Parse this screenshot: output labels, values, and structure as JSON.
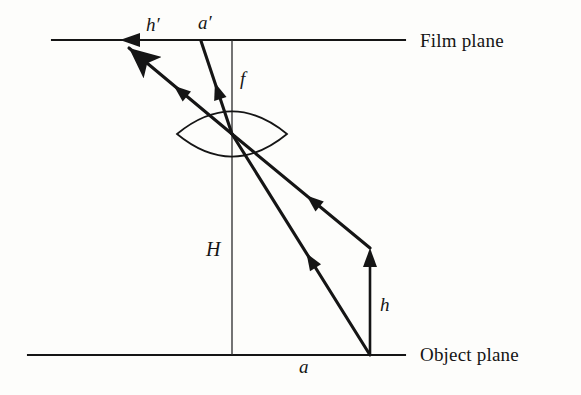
{
  "figure": {
    "kind": "thin-lens-imaging-diagram",
    "background_color": "#fdfdfb",
    "ink_color": "#151515"
  },
  "planes": {
    "film": {
      "label": "Film plane",
      "label_x": 420,
      "label_y": 30,
      "line_y": 40,
      "line_x1": 52,
      "line_x2": 405
    },
    "object": {
      "label": "Object plane",
      "label_x": 420,
      "label_y": 344,
      "line_y": 355,
      "line_x1": 28,
      "line_x2": 405
    }
  },
  "axis": {
    "name": "optical-axis",
    "x": 232,
    "y_top": 40,
    "y_bottom": 355
  },
  "lens": {
    "name": "biconvex-lens",
    "center_x": 232,
    "center_y": 134,
    "half_width": 55,
    "half_height": 21
  },
  "object_arrow": {
    "name": "object-height-arrow",
    "x": 370,
    "y_base": 355,
    "y_tip": 248
  },
  "rays": [
    {
      "name": "chief-ray-from-object-base",
      "from_x": 370,
      "from_y": 355,
      "through_x": 232,
      "through_y": 134,
      "to_x": 120,
      "to_y": 41
    },
    {
      "name": "ray-from-object-tip",
      "from_x": 370,
      "from_y": 248,
      "through_x": 232,
      "through_y": 134,
      "to_x": 201,
      "to_y": 41
    }
  ],
  "labels": {
    "image_height": {
      "text": "h′",
      "x": 146,
      "y": 14
    },
    "image_distance": {
      "text": "a′",
      "x": 198,
      "y": 12
    },
    "focal_length": {
      "text": "f",
      "x": 240,
      "y": 68
    },
    "camera_height": {
      "text": "H",
      "x": 206,
      "y": 238
    },
    "object_height": {
      "text": "h",
      "x": 380,
      "y": 294
    },
    "object_distance": {
      "text": "a",
      "x": 299,
      "y": 356
    }
  },
  "chart_data": {
    "type": "diagram",
    "quantities": [
      {
        "symbol": "h",
        "meaning": "object height"
      },
      {
        "symbol": "h′",
        "meaning": "image height"
      },
      {
        "symbol": "a",
        "meaning": "object distance along object plane"
      },
      {
        "symbol": "a′",
        "meaning": "image distance along film plane"
      },
      {
        "symbol": "f",
        "meaning": "focal length"
      },
      {
        "symbol": "H",
        "meaning": "distance from lens to object plane"
      }
    ]
  }
}
